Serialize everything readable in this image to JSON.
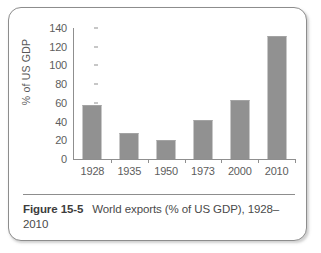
{
  "figure": {
    "label": "Figure 15-5",
    "caption": "World exports (% of US GDP), 1928–2010"
  },
  "chart_data": {
    "type": "bar",
    "title": "",
    "xlabel": "",
    "ylabel": "% of US GDP",
    "categories": [
      "1928",
      "1935",
      "1950",
      "1973",
      "2000",
      "2010"
    ],
    "values": [
      57,
      27,
      19,
      41,
      62,
      130
    ],
    "ylim": [
      0,
      140
    ],
    "yticks": [
      0,
      20,
      40,
      60,
      80,
      100,
      120,
      140
    ],
    "ytick_labels": [
      "0",
      "20",
      "40",
      "60",
      "80",
      "100",
      "120",
      "140"
    ],
    "grid": false,
    "legend": false,
    "bar_color": "#919191",
    "axis_color": "#8f8f8f",
    "text_color": "#5d5d5d"
  }
}
